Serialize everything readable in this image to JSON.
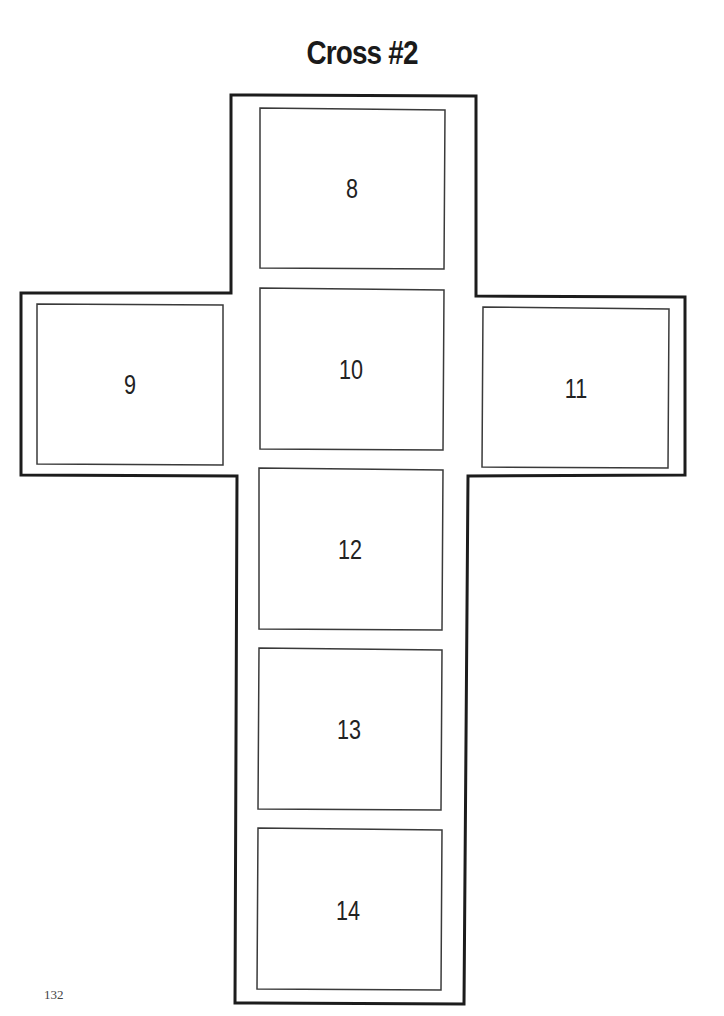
{
  "title": "Cross #2",
  "page_number": "132",
  "boxes": [
    {
      "label": "8",
      "cx": 352,
      "cy": 189
    },
    {
      "label": "9",
      "cx": 130,
      "cy": 385
    },
    {
      "label": "10",
      "cx": 351,
      "cy": 370
    },
    {
      "label": "11",
      "cx": 576,
      "cy": 389
    },
    {
      "label": "12",
      "cx": 350,
      "cy": 550
    },
    {
      "label": "13",
      "cx": 349,
      "cy": 730
    },
    {
      "label": "14",
      "cx": 348,
      "cy": 911
    }
  ]
}
